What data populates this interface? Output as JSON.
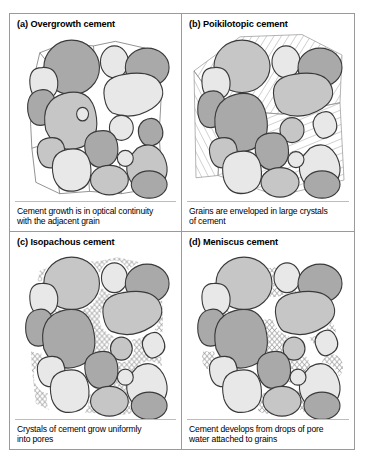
{
  "figure": {
    "panels": [
      {
        "id": "a",
        "title": "(a) Overgrowth cement",
        "caption_lines": [
          "Cement growth is in optical continuity",
          "with the adjacent grain"
        ],
        "cement_style": "overgrowth",
        "cement_description": "Thin rims of cement grown in optical continuity around each detrital grain, filling pore space with straight polygonal boundaries."
      },
      {
        "id": "b",
        "title": "(b) Poikilotopic cement",
        "caption_lines": [
          "Grains are enveloped in large crystals",
          "of cement"
        ],
        "cement_style": "poikilotopic",
        "cement_description": "Pore space filled by a few very large cement crystals, shown as domains of parallel hatching at differing orientations that envelop several grains."
      },
      {
        "id": "c",
        "title": "(c) Isopachous cement",
        "caption_lines": [
          "Crystals of cement grow uniformly",
          "into pores"
        ],
        "cement_style": "isopachous",
        "cement_description": "Even thickness scalloped crystal fringe lining every grain surface uniformly around the pores."
      },
      {
        "id": "d",
        "title": "(d) Meniscus cement",
        "caption_lines": [
          "Cement develops from drops of pore",
          "water attached to grains"
        ],
        "cement_style": "meniscus",
        "cement_description": "Cement concentrated at grain-to-grain contacts as curved menisci, leaving the centres of pores open."
      }
    ]
  },
  "colors": {
    "grain_light": "#e8e8e8",
    "grain_mid_light": "#d8d8d8",
    "grain_mid": "#c6c6c6",
    "grain_dark": "#a9a9a9",
    "grain_outline": "#3a3a3a",
    "cement_line": "#6e6e6e",
    "frame": "#9a9a9a",
    "background": "#ffffff",
    "text": "#000000"
  }
}
